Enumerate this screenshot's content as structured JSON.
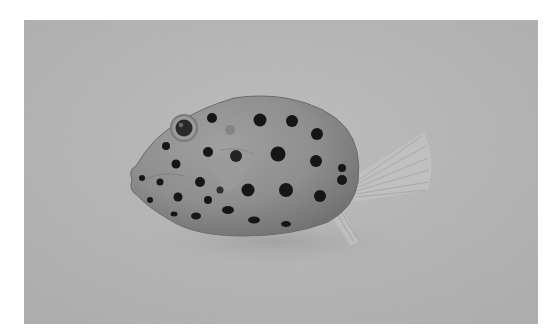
{
  "image": {
    "subject": "spotted boxfish",
    "description": "Grayscale photograph of a spotted boxfish on a plain light surface",
    "frame": {
      "x": 24,
      "y": 20,
      "width": 514,
      "height": 304
    },
    "colors": {
      "page_background": "#ffffff",
      "photo_background": "#b4b4b4",
      "fish_body": "#8c8c8c",
      "fish_highlight": "#a2a2a2",
      "spots": "#161616",
      "fins": "#c4c4c4",
      "shadow": "#a6a6a6"
    }
  }
}
